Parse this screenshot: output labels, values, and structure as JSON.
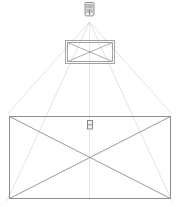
{
  "diagram": {
    "title": "Projection geometry diagram",
    "description": "A projector at the top emits a light cone downward through an intermediate rectangular frame onto a larger rectangular screen below.",
    "background_color": "#ffffff",
    "ray_color": "#cfcfcf",
    "frame_color": "#8d8d8d",
    "device_color": "#6f6f6f",
    "nodes": {
      "projector": {
        "label": "projector",
        "x": 89.5,
        "y": 10,
        "width": 12,
        "height": 15
      },
      "intermediate_frame": {
        "label": "intermediate frame",
        "x": 65,
        "y": 40,
        "width": 50,
        "height": 24,
        "has_diagonals": true
      },
      "screen_frame": {
        "label": "screen",
        "x": 9,
        "y": 116,
        "width": 162,
        "height": 83,
        "has_diagonals": true
      },
      "screen_device": {
        "label": "device marker",
        "x": 87,
        "y": 120,
        "width": 6,
        "height": 9
      }
    },
    "rays": {
      "count": 5,
      "origin_x": 89.5,
      "origin_y": 22,
      "targets": [
        {
          "x": 9,
          "y": 199
        },
        {
          "x": 9,
          "y": 116
        },
        {
          "x": 89.5,
          "y": 199
        },
        {
          "x": 171,
          "y": 116
        },
        {
          "x": 171,
          "y": 199
        }
      ]
    }
  }
}
